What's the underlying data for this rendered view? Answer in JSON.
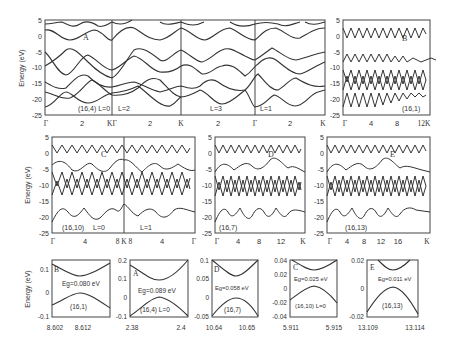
{
  "figure": {
    "ylabel": "Energy (eV)",
    "row1": {
      "panel_main": {
        "label": "A",
        "annotation": "(16,4) L=0",
        "segment_labels": [
          "L=2",
          "L=3",
          "L=1"
        ],
        "yticks": [
          "5",
          "0",
          "-5",
          "-10",
          "-15",
          "-20",
          "-25"
        ],
        "xticks": [
          "Γ",
          "2",
          "KΓ",
          "2",
          "K",
          "2",
          "Γ",
          "2",
          "K"
        ]
      },
      "panel_b": {
        "label": "B",
        "annotation": "(16,1)",
        "yticks": [
          "5",
          "0",
          "-5",
          "-10",
          "-15",
          "-20",
          "-25"
        ],
        "xticks": [
          "Γ",
          "4",
          "8",
          "12K"
        ]
      }
    },
    "row2": {
      "panel_c": {
        "label": "C",
        "annotation": "(16,10)",
        "segment_labels": [
          "L=0",
          "L=1"
        ],
        "yticks": [
          "5",
          "0",
          "-5",
          "-10",
          "-15",
          "-20",
          "-25"
        ],
        "xticks": [
          "Γ",
          "4",
          "8 K 8",
          "4",
          "Γ"
        ]
      },
      "panel_d": {
        "label": "D",
        "annotation": "(16,7)",
        "yticks": [
          "5",
          "0",
          "-5",
          "-10",
          "-15",
          "-20",
          "-25"
        ],
        "xticks": [
          "Γ",
          "4",
          "8",
          "12",
          "K"
        ]
      },
      "panel_e": {
        "label": "E",
        "annotation": "(16,13)",
        "yticks": [
          "5",
          "0",
          "-5",
          "-10",
          "-15",
          "-20",
          "-25"
        ],
        "xticks": [
          "Γ",
          "4",
          "8",
          "12",
          "16",
          "K"
        ]
      }
    },
    "row3": [
      {
        "label": "B",
        "gap": "Eg=0.080 eV",
        "annotation": "(16,1)",
        "yticks": [
          "0.1",
          "0",
          "-0.1"
        ],
        "xticks": [
          "8.602",
          "8.612"
        ]
      },
      {
        "label": "A",
        "gap": "Eg=0.089 eV",
        "annotation": "(16,4) L=0",
        "yticks": [
          "0.2",
          "0.1",
          "0",
          "-0.1"
        ],
        "xticks": [
          "2.38",
          "2.4"
        ]
      },
      {
        "label": "D",
        "gap": "Eg=0.058 eV",
        "annotation": "(16,7)",
        "yticks": [
          "0.1",
          "0.05",
          "0",
          "-0.05"
        ],
        "xticks": [
          "10.64",
          "10.65"
        ]
      },
      {
        "label": "C",
        "gap": "Eg=0.025 eV",
        "annotation": "(16,10) L=0",
        "yticks": [
          "0.04",
          "0.02",
          "0",
          "-0.02",
          "-0.04"
        ],
        "xticks": [
          "5.911",
          "5.915"
        ]
      },
      {
        "label": "E",
        "gap": "Eg=0.011 eV",
        "annotation": "(16,13)",
        "yticks": [
          "0.02",
          "0",
          "-0.02"
        ],
        "xticks": [
          "13.109",
          "13.114"
        ]
      }
    ]
  }
}
